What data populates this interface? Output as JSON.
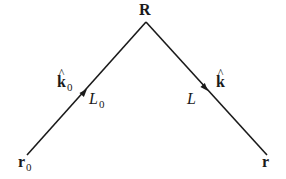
{
  "diagram": {
    "points": {
      "apex": {
        "label": "R",
        "x": 146,
        "y": 22
      },
      "start": {
        "label": "r",
        "subscript": "0",
        "x": 27,
        "y": 155
      },
      "end": {
        "label": "r",
        "x": 267,
        "y": 155
      }
    },
    "segments": {
      "incoming": {
        "length_label": "L",
        "length_subscript": "0",
        "direction_label": "k",
        "direction_hat": "^",
        "direction_subscript": "0",
        "arrow": {
          "x": 85,
          "y": 91
        }
      },
      "outgoing": {
        "length_label": "L",
        "direction_label": "k",
        "direction_hat": "^",
        "arrow": {
          "x": 207,
          "y": 90
        }
      }
    },
    "colors": {
      "line": "#1a1a1a",
      "background": "#ffffff"
    }
  }
}
